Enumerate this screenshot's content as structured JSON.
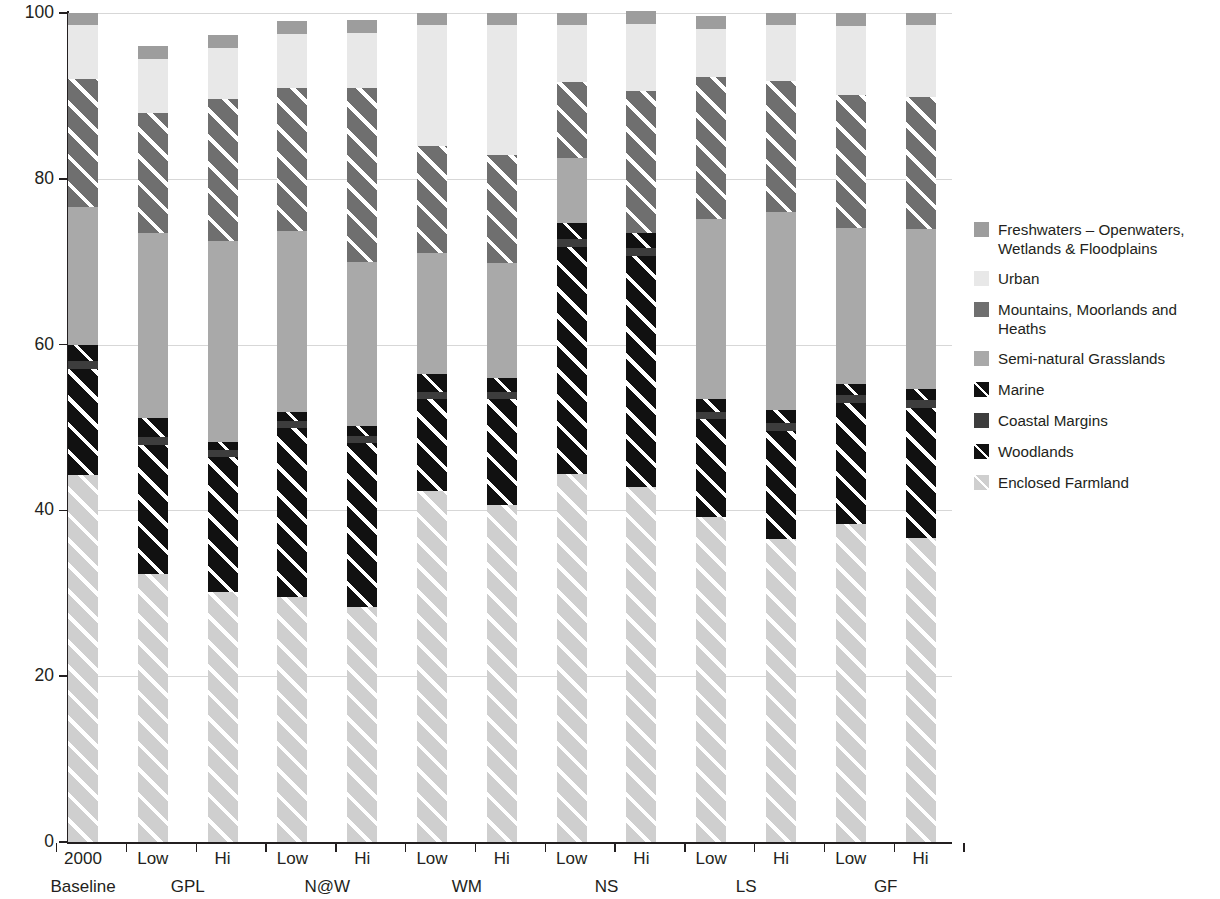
{
  "chart_data": {
    "type": "bar",
    "subtype": "stacked-percentage",
    "title": "",
    "xlabel": "",
    "ylabel": "",
    "ylim": [
      0,
      100
    ],
    "yticks": [
      0,
      20,
      40,
      60,
      80,
      100
    ],
    "grid": true,
    "legend_position": "right",
    "stack_order_bottom_to_top": [
      "Enclosed Farmland",
      "Marine",
      "Coastal Margins",
      "Woodlands",
      "Semi-natural Grasslands",
      "Mountains, Moorlands and Heaths",
      "Urban",
      "Freshwaters – Openwaters, Wetlands & Floodplains"
    ],
    "categories": [
      "2000 Baseline",
      "GPL Low",
      "GPL Hi",
      "N@W Low",
      "N@W Hi",
      "WM Low",
      "WM Hi",
      "NS Low",
      "NS Hi",
      "LS Low",
      "LS Hi",
      "GF Low",
      "GF Hi"
    ],
    "tick_labels": [
      "2000",
      "Low",
      "Hi",
      "Low",
      "Hi",
      "Low",
      "Hi",
      "Low",
      "Hi",
      "Low",
      "Hi",
      "Low",
      "Hi"
    ],
    "group_labels": [
      "Baseline",
      "GPL",
      "N@W",
      "WM",
      "NS",
      "LS",
      "GF"
    ],
    "series": [
      {
        "name": "Enclosed Farmland",
        "values": [
          44.3,
          32.3,
          30.1,
          29.6,
          28.3,
          42.3,
          40.6,
          44.4,
          42.8,
          39.2,
          36.6,
          38.4,
          36.7
        ]
      },
      {
        "name": "Marine",
        "values": [
          12.8,
          15.6,
          16.3,
          20.3,
          19.8,
          11.1,
          12.8,
          27.4,
          27.9,
          11.8,
          13.0,
          14.6,
          15.7
        ]
      },
      {
        "name": "Coastal Margins",
        "values": [
          0.9,
          0.9,
          0.9,
          0.9,
          0.9,
          0.9,
          0.9,
          0.9,
          0.9,
          0.9,
          0.9,
          0.9,
          0.9
        ]
      },
      {
        "name": "Woodlands",
        "values": [
          2.0,
          2.4,
          0.9,
          1.1,
          1.2,
          2.2,
          1.7,
          2.0,
          1.9,
          1.6,
          1.6,
          1.4,
          1.3
        ]
      },
      {
        "name": "Semi-natural Grasslands",
        "values": [
          16.6,
          22.3,
          24.3,
          21.8,
          19.8,
          14.6,
          13.9,
          7.8,
          0.0,
          21.6,
          23.9,
          18.8,
          19.4
        ]
      },
      {
        "name": "Mountains, Moorlands and Heaths",
        "values": [
          15.4,
          14.4,
          17.1,
          17.2,
          20.9,
          12.9,
          13.0,
          9.2,
          17.1,
          17.2,
          15.8,
          16.0,
          15.9
        ]
      },
      {
        "name": "Urban",
        "values": [
          6.5,
          6.6,
          6.2,
          6.6,
          6.7,
          14.5,
          15.6,
          6.8,
          8.1,
          5.8,
          6.7,
          8.3,
          8.6
        ]
      },
      {
        "name": "Freshwaters – Openwaters, Wetlands & Floodplains",
        "values": [
          1.5,
          1.5,
          1.5,
          1.5,
          1.5,
          1.5,
          1.5,
          1.5,
          1.5,
          1.5,
          1.5,
          1.6,
          1.5
        ]
      }
    ],
    "colors": {
      "Freshwaters – Openwaters, Wetlands & Floodplains": "#9d9d9d",
      "Urban": "#e8e8e8",
      "Mountains, Moorlands and Heaths": "#6f6f6f",
      "Semi-natural Grasslands": "#a9a9a9",
      "Marine": "#111111",
      "Coastal Margins": "#3d3d3d",
      "Woodlands": "#111111",
      "Enclosed Farmland": "#cfcfcf"
    }
  },
  "legend": {
    "items": [
      {
        "label": "Freshwaters – Openwaters,",
        "label2": "Wetlands & Floodplains",
        "swatch": "freshwaters-swatch"
      },
      {
        "label": "Urban",
        "label2": "",
        "swatch": "urban-swatch"
      },
      {
        "label": "Mountains, Moorlands and Heaths",
        "label2": "",
        "swatch": "mountains-swatch"
      },
      {
        "label": "Semi-natural Grasslands",
        "label2": "",
        "swatch": "grasslands-swatch"
      },
      {
        "label": "Marine",
        "label2": "",
        "swatch": "marine-swatch"
      },
      {
        "label": "Coastal Margins",
        "label2": "",
        "swatch": "coastal-swatch"
      },
      {
        "label": "Woodlands",
        "label2": "",
        "swatch": "woodlands-swatch"
      },
      {
        "label": "Enclosed Farmland",
        "label2": "",
        "swatch": "farmland-swatch"
      }
    ]
  }
}
